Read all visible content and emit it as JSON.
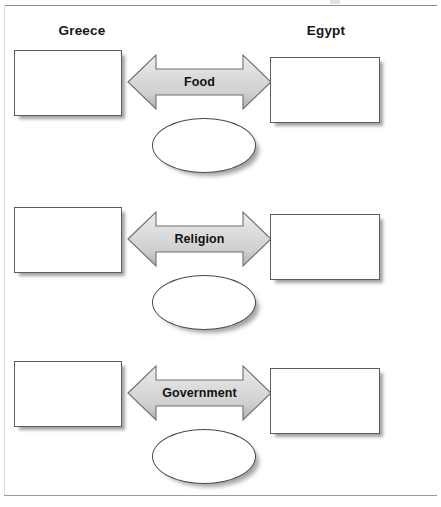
{
  "page": {
    "background_color": "#ffffff",
    "rule_color": "#8d8d8d"
  },
  "headings": {
    "left": "Greece",
    "right": "Egypt"
  },
  "arrow": {
    "fill_light": "#e3e3e3",
    "fill_mid": "#d2d2d2",
    "fill_dark": "#a8a8a8",
    "stroke": "#6a6a6a"
  },
  "rows": [
    {
      "topic": "Food",
      "left_box_value": "",
      "right_box_value": "",
      "ellipse_value": ""
    },
    {
      "topic": "Religion",
      "left_box_value": "",
      "right_box_value": "",
      "ellipse_value": ""
    },
    {
      "topic": "Government",
      "left_box_value": "",
      "right_box_value": "",
      "ellipse_value": ""
    }
  ]
}
